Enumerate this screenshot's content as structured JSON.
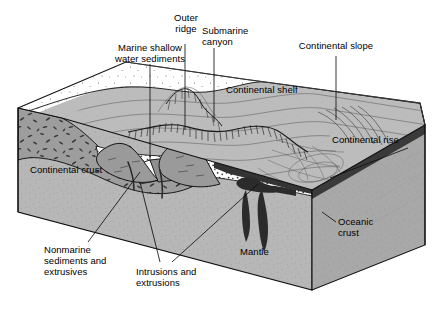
{
  "figure": {
    "type": "geologic-block-diagram",
    "background_color": "#ffffff",
    "line_color": "#000000"
  },
  "labels": {
    "marine_shallow": "Marine shallow\nwater sediments",
    "outer_ridge": "Outer\nridge",
    "submarine_canyon": "Submarine\ncanyon",
    "continental_slope": "Continental slope",
    "continental_shelf": "Continental shelf",
    "continental_rise": "Continental rise",
    "oceanic_crust": "Oceanic\ncrust",
    "continental_crust": "Continental crust",
    "mantle": "Mantle",
    "nonmarine": "Nonmarine\nsediments and\nextrusives",
    "intrusions": "Intrusions and\nextrusions"
  },
  "palette": {
    "mantle_front": "#b6b6b6",
    "mantle_right": "#a9a9a9",
    "continental_crust": "#9a9a9a",
    "sea_floor": "#b9b9b9",
    "land_surface": "#ffffff",
    "oceanic_crust_dark": "#3a3a3a",
    "intrusion_dark": "#2e2e2e",
    "stipple_band": "#ffffff",
    "outline": "#000000"
  }
}
